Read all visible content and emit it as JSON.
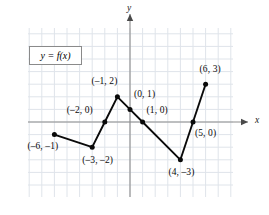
{
  "chart_data": {
    "type": "line",
    "title": "",
    "xlabel": "x",
    "ylabel": "y",
    "legend_label": "y = f(x)",
    "legend_position": "upper-left-inside",
    "grid": true,
    "xlim": [
      -8,
      8
    ],
    "ylim": [
      -6,
      7
    ],
    "x": [
      -6,
      -3,
      -2,
      -1,
      0,
      1,
      4,
      5,
      6
    ],
    "values": [
      -1,
      -2,
      0,
      2,
      1,
      0,
      -3,
      0,
      3
    ],
    "points": [
      {
        "x": -6,
        "y": -1,
        "label": "(–6, –1)",
        "label_dx": -27,
        "label_dy": 12
      },
      {
        "x": -3,
        "y": -2,
        "label": "(–3, –2)",
        "label_dx": -10,
        "label_dy": 14
      },
      {
        "x": -2,
        "y": 0,
        "label": "(–2, 0)",
        "label_dx": -38,
        "label_dy": -11
      },
      {
        "x": -1,
        "y": 2,
        "label": "(–1, 2)",
        "label_dx": -26,
        "label_dy": -15
      },
      {
        "x": 0,
        "y": 1,
        "label": "(0, 1)",
        "label_dx": 4,
        "label_dy": -14
      },
      {
        "x": 1,
        "y": 0,
        "label": "(1, 0)",
        "label_dx": 4,
        "label_dy": -11
      },
      {
        "x": 4,
        "y": -3,
        "label": "(4, –3)",
        "label_dx": -12,
        "label_dy": 13
      },
      {
        "x": 5,
        "y": 0,
        "label": "(5, 0)",
        "label_dx": 2,
        "label_dy": 12
      },
      {
        "x": 6,
        "y": 3,
        "label": "(6, 3)",
        "label_dx": -6,
        "label_dy": -14
      }
    ],
    "colors": {
      "curve": "#0a0a0a",
      "point": "#0a0a0a",
      "grid": "#dfe4ea",
      "axis": "#8c8c8c",
      "legend_border": "#8a8a8a",
      "background": "#ffffff"
    }
  }
}
